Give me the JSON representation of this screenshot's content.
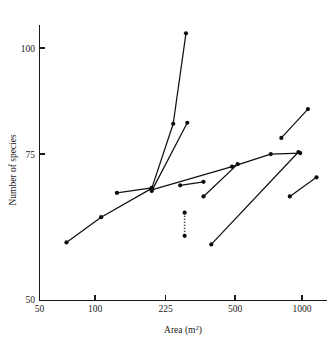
{
  "chart_data": {
    "type": "scatter",
    "title": "",
    "xlabel": "Area (m2)",
    "xlabel_base": "Area (m",
    "xlabel_sup": "2",
    "xlabel_close": ")",
    "ylabel": "Number of species",
    "xscale": "log",
    "yscale": "linear",
    "xlim": [
      50,
      1300
    ],
    "ylim": [
      50,
      107
    ],
    "grid": false,
    "legend": "none",
    "xticks": [
      50,
      100,
      225,
      500,
      1000
    ],
    "xtick_labels": [
      "50",
      "100",
      "225",
      "500",
      "1000"
    ],
    "yticks": [
      50,
      75,
      100
    ],
    "ytick_labels": [
      "50",
      "75",
      "100"
    ],
    "series": [
      {
        "name": "series-1",
        "style": "solid",
        "x": [
          68,
          101,
          180,
          230,
          266
        ],
        "y": [
          61.5,
          66.5,
          72.2,
          85.0,
          102.9
        ]
      },
      {
        "name": "series-2",
        "style": "solid",
        "x": [
          121,
          180
        ],
        "y": [
          71.3,
          72.3
        ]
      },
      {
        "name": "series-3",
        "style": "solid",
        "x": [
          180,
          270
        ],
        "y": [
          71.7,
          85.2
        ]
      },
      {
        "name": "series-4",
        "style": "solid",
        "x": [
          180,
          450,
          700,
          980
        ],
        "y": [
          71.9,
          76.5,
          79.0,
          79.2
        ]
      },
      {
        "name": "series-5",
        "style": "solid",
        "x": [
          249,
          325
        ],
        "y": [
          72.8,
          73.5
        ]
      },
      {
        "name": "series-6",
        "style": "solid",
        "x": [
          325,
          480
        ],
        "y": [
          70.6,
          77.0
        ]
      },
      {
        "name": "series-7",
        "style": "solid",
        "x": [
          355,
          960
        ],
        "y": [
          61.1,
          79.4
        ]
      },
      {
        "name": "series-8",
        "style": "solid",
        "x": [
          790,
          1070
        ],
        "y": [
          82.2,
          87.9
        ]
      },
      {
        "name": "series-9",
        "style": "solid",
        "x": [
          870,
          1180
        ],
        "y": [
          70.6,
          74.4
        ]
      },
      {
        "name": "series-10",
        "style": "dotted",
        "x": [
          262,
          262
        ],
        "y": [
          67.4,
          62.8
        ]
      }
    ]
  },
  "axes": {
    "y_axis_name": "y-axis",
    "x_axis_name": "x-axis"
  }
}
